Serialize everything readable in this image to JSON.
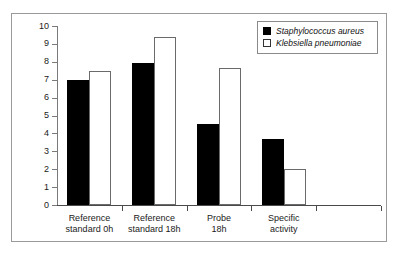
{
  "chart_data": {
    "type": "bar",
    "title": "",
    "xlabel": "",
    "ylabel": "log CFU",
    "ylim": [
      0,
      10
    ],
    "yticks": [
      0,
      1,
      2,
      3,
      4,
      5,
      6,
      7,
      8,
      9,
      10
    ],
    "ytick_labels": [
      "0",
      "1",
      "2",
      "3",
      "4",
      "5",
      "6",
      "7",
      "8",
      "9",
      "10"
    ],
    "grid": false,
    "legend_position": "top-right",
    "categories": [
      "Reference standard 0h",
      "Reference standard 18h",
      "Probe 18h",
      "Specific activity"
    ],
    "category_lines": [
      [
        "Reference",
        "standard 0h"
      ],
      [
        "Reference",
        "standard 18h"
      ],
      [
        "Probe",
        "18h"
      ],
      [
        "Specific",
        "activity"
      ]
    ],
    "series": [
      {
        "name": "Staphylococcus aureus",
        "style": "filled",
        "color": "#000000",
        "values": [
          7.0,
          7.95,
          4.5,
          3.7
        ]
      },
      {
        "name": "Klebsiella pneumoniae",
        "style": "open",
        "color": "#ffffff",
        "edge_color": "#6a6a6a",
        "values": [
          7.5,
          9.4,
          7.65,
          2.0
        ]
      }
    ]
  },
  "legend": {
    "entries": [
      {
        "label": "Staphylococcus aureus",
        "swatch": "filled-square-icon"
      },
      {
        "label": "Klebsiella pneumoniae",
        "swatch": "open-square-icon"
      }
    ]
  },
  "axis": {
    "y_label": "log CFU"
  }
}
